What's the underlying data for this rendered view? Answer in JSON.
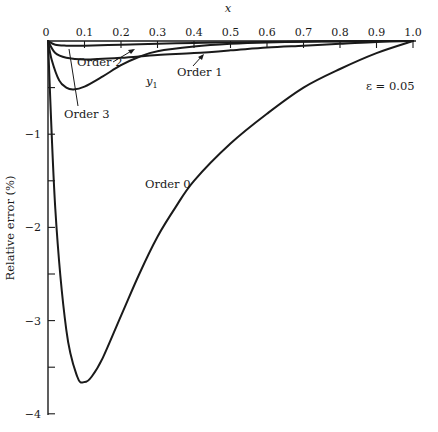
{
  "chart_data": {
    "type": "line",
    "title": "",
    "xlabel": "x",
    "ylabel": "Relative error (%)",
    "xlim": [
      0,
      1.0
    ],
    "ylim": [
      -4,
      0
    ],
    "x_ticks": [
      "0",
      "0.1",
      "0.2",
      "0.3",
      "0.4",
      "0.5",
      "0.6",
      "0.7",
      "0.8",
      "0.9",
      "1.0"
    ],
    "y_ticks": [
      "0",
      "−1",
      "−2",
      "−3",
      "−4"
    ],
    "grid": false,
    "legend": "none (inline annotations)",
    "annotations": {
      "epsilon": "ε = 0.05",
      "y1_label": "y",
      "y1_sub": "1"
    },
    "series": [
      {
        "name": "Order 0",
        "x": [
          0,
          0.02,
          0.05,
          0.08,
          0.1,
          0.12,
          0.15,
          0.2,
          0.25,
          0.3,
          0.35,
          0.4,
          0.5,
          0.6,
          0.7,
          0.8,
          0.9,
          1.0
        ],
        "y": [
          0,
          -1.8,
          -3.1,
          -3.6,
          -3.66,
          -3.6,
          -3.4,
          -2.95,
          -2.5,
          -2.1,
          -1.78,
          -1.5,
          -1.1,
          -0.78,
          -0.5,
          -0.3,
          -0.13,
          0
        ]
      },
      {
        "name": "Order 1",
        "x": [
          0,
          0.02,
          0.05,
          0.1,
          0.2,
          0.3,
          0.4,
          0.5,
          0.6,
          0.7,
          0.8,
          0.9,
          1.0
        ],
        "y": [
          0,
          -0.13,
          -0.18,
          -0.2,
          -0.18,
          -0.15,
          -0.13,
          -0.1,
          -0.07,
          -0.05,
          -0.03,
          -0.01,
          0
        ]
      },
      {
        "name": "Order 2",
        "x": [
          0,
          0.02,
          0.05,
          0.1,
          0.2,
          0.3,
          0.4,
          0.5,
          0.6,
          0.7,
          0.8,
          0.9,
          1.0
        ],
        "y": [
          0,
          -0.04,
          -0.05,
          -0.05,
          -0.04,
          -0.03,
          -0.02,
          -0.015,
          -0.01,
          -0.005,
          -0.003,
          -0.001,
          0
        ]
      },
      {
        "name": "Order 3",
        "x": [
          0,
          0.01,
          0.03,
          0.05,
          0.07,
          0.1,
          0.15,
          0.2,
          0.25,
          0.3,
          0.4,
          0.5,
          0.6,
          0.7,
          0.8,
          0.9,
          1.0
        ],
        "y": [
          0,
          -0.2,
          -0.42,
          -0.5,
          -0.52,
          -0.49,
          -0.38,
          -0.26,
          -0.17,
          -0.11,
          -0.06,
          -0.03,
          -0.015,
          -0.008,
          -0.004,
          -0.001,
          0
        ]
      }
    ],
    "labels": {
      "order0": "Order 0",
      "order1": "Order 1",
      "order2": "Order 2",
      "order3": "Order 3"
    }
  }
}
